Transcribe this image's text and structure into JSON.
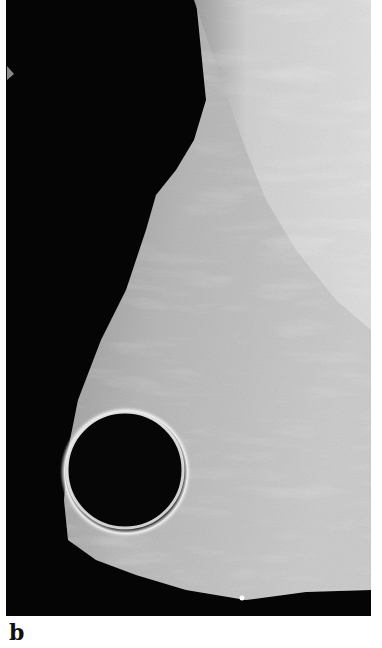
{
  "figure": {
    "panel_label": "b",
    "image_type": "mammogram",
    "colors": {
      "background": "#050505",
      "tissue_dense": "#d8d8d8",
      "tissue_mid": "#a8a8a8",
      "lesion": "#060606",
      "rim": "#efefef"
    }
  }
}
